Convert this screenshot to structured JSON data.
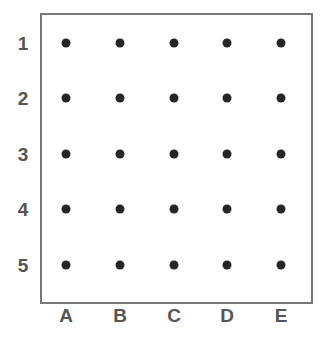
{
  "figure": {
    "name": "grid-dot-matrix",
    "background_color": "#ffffff",
    "frame": {
      "border_color": "#777777",
      "border_width_px": 2,
      "x": 40,
      "y": 13,
      "width": 273,
      "height": 291
    },
    "dot_color": "#262626",
    "dot_diameter_px": 9,
    "label_color": "#555555"
  },
  "chart_data": {
    "type": "scatter",
    "title": "",
    "subtitle": "",
    "xlabel": "",
    "ylabel": "",
    "grid": false,
    "legend": null,
    "columns": [
      "A",
      "B",
      "C",
      "D",
      "E"
    ],
    "rows": [
      "1",
      "2",
      "3",
      "4",
      "5"
    ],
    "column_centers_px": [
      66,
      120,
      174,
      227,
      281
    ],
    "row_centers_px": [
      43,
      98,
      154,
      209,
      265
    ],
    "row_label_x_px": 23,
    "column_label_y_px": 315,
    "points": [
      {
        "col": "A",
        "row": "1",
        "x": 66,
        "y": 43
      },
      {
        "col": "B",
        "row": "1",
        "x": 120,
        "y": 43
      },
      {
        "col": "C",
        "row": "1",
        "x": 174,
        "y": 43
      },
      {
        "col": "D",
        "row": "1",
        "x": 227,
        "y": 43
      },
      {
        "col": "E",
        "row": "1",
        "x": 281,
        "y": 43
      },
      {
        "col": "A",
        "row": "2",
        "x": 66,
        "y": 98
      },
      {
        "col": "B",
        "row": "2",
        "x": 120,
        "y": 98
      },
      {
        "col": "C",
        "row": "2",
        "x": 174,
        "y": 98
      },
      {
        "col": "D",
        "row": "2",
        "x": 227,
        "y": 98
      },
      {
        "col": "E",
        "row": "2",
        "x": 281,
        "y": 98
      },
      {
        "col": "A",
        "row": "3",
        "x": 66,
        "y": 154
      },
      {
        "col": "B",
        "row": "3",
        "x": 120,
        "y": 154
      },
      {
        "col": "C",
        "row": "3",
        "x": 174,
        "y": 154
      },
      {
        "col": "D",
        "row": "3",
        "x": 227,
        "y": 154
      },
      {
        "col": "E",
        "row": "3",
        "x": 281,
        "y": 154
      },
      {
        "col": "A",
        "row": "4",
        "x": 66,
        "y": 209
      },
      {
        "col": "B",
        "row": "4",
        "x": 120,
        "y": 209
      },
      {
        "col": "C",
        "row": "4",
        "x": 174,
        "y": 209
      },
      {
        "col": "D",
        "row": "4",
        "x": 227,
        "y": 209
      },
      {
        "col": "E",
        "row": "4",
        "x": 281,
        "y": 209
      },
      {
        "col": "A",
        "row": "5",
        "x": 66,
        "y": 265
      },
      {
        "col": "B",
        "row": "5",
        "x": 120,
        "y": 265
      },
      {
        "col": "C",
        "row": "5",
        "x": 174,
        "y": 265
      },
      {
        "col": "D",
        "row": "5",
        "x": 227,
        "y": 265
      },
      {
        "col": "E",
        "row": "5",
        "x": 281,
        "y": 265
      }
    ]
  }
}
